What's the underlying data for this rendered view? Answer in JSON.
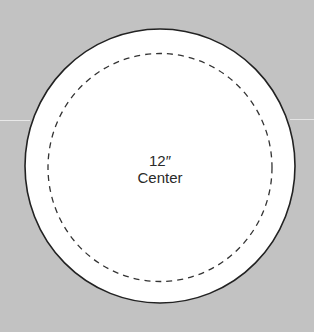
{
  "diagram": {
    "background_color": "#c2c2c2",
    "outer_circle": {
      "cx": 160,
      "cy": 166,
      "rx": 135,
      "ry": 137,
      "fill": "#ffffff",
      "stroke": "#222222"
    },
    "inner_circle": {
      "cx": 160,
      "cy": 167,
      "rx": 112,
      "ry": 114,
      "stroke": "#333333",
      "style": "dashed"
    },
    "label": {
      "size": "12″",
      "position": "Center"
    }
  }
}
